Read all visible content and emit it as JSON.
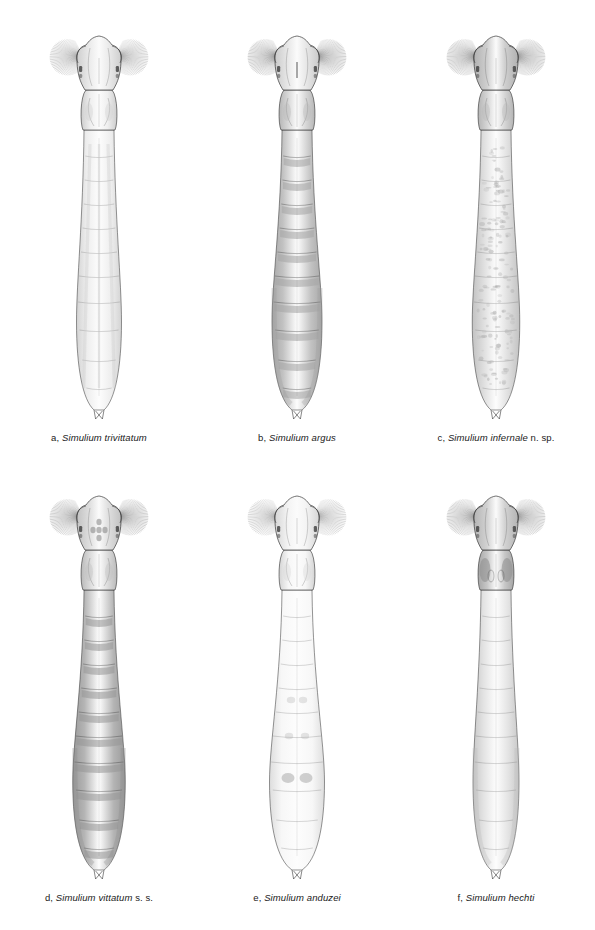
{
  "plate": {
    "type": "taxonomic-figure-plate",
    "background_color": "#ffffff",
    "ink_color": "#2b2b2b",
    "columns": 3,
    "rows": 2,
    "subject": "Simuliidae larvae, dorsal view",
    "panels": [
      {
        "letter": "a,",
        "genus": "Simulium",
        "species": "trivittatum",
        "qualifier": "",
        "caption_full": "a, Simulium trivittatum",
        "col": 0,
        "row": 0,
        "body_tone": "#f2f2f2",
        "abdomen_tone": "#ededed",
        "head_tone": "#ececec",
        "thorax_tone": "#efefef",
        "pattern": "faint-longitudinal-stripes",
        "abdomen_swell": 0.9,
        "fan_density": 46,
        "fan_tone": "#7d7d7d"
      },
      {
        "letter": "b,",
        "genus": "Simulium",
        "species": "argus",
        "qualifier": "",
        "caption_full": "b, Simulium argus",
        "col": 1,
        "row": 0,
        "body_tone": "#e6e6e6",
        "abdomen_tone": "#c2c2c2",
        "head_tone": "#e8e8e8",
        "thorax_tone": "#d8d8d8",
        "pattern": "banded-grey-abdomen",
        "abdomen_swell": 1.0,
        "fan_density": 50,
        "fan_tone": "#6e6e6e"
      },
      {
        "letter": "c,",
        "genus": "Simulium",
        "species": "infernale",
        "qualifier": "n. sp.",
        "caption_full": "c, Simulium infernale n. sp.",
        "col": 2,
        "row": 0,
        "body_tone": "#eaeaea",
        "abdomen_tone": "#dcdcdc",
        "head_tone": "#cfcfcf",
        "thorax_tone": "#d6d6d6",
        "pattern": "mottled-reticulate",
        "abdomen_swell": 0.95,
        "fan_density": 52,
        "fan_tone": "#707070"
      },
      {
        "letter": "d,",
        "genus": "Simulium",
        "species": "vittatum",
        "qualifier": "s. s.",
        "caption_full": "d, Simulium vittatum s. s.",
        "col": 0,
        "row": 1,
        "body_tone": "#e4e4e4",
        "abdomen_tone": "#b4b4b4",
        "head_tone": "#e0e0e0",
        "thorax_tone": "#dcdcdc",
        "pattern": "dark-banded-abdomen",
        "abdomen_swell": 1.05,
        "fan_density": 48,
        "fan_tone": "#6a6a6a"
      },
      {
        "letter": "e,",
        "genus": "Simulium",
        "species": "anduzei",
        "qualifier": "",
        "caption_full": "e, Simulium anduzei",
        "col": 1,
        "row": 1,
        "body_tone": "#fafafa",
        "abdomen_tone": "#f7f7f7",
        "head_tone": "#f4f4f4",
        "thorax_tone": "#f6f6f6",
        "pattern": "pale-with-paired-spots",
        "abdomen_swell": 1.1,
        "fan_density": 44,
        "fan_tone": "#828282"
      },
      {
        "letter": "f,",
        "genus": "Simulium",
        "species": "hechti",
        "qualifier": "",
        "caption_full": "f, Simulium hechti",
        "col": 2,
        "row": 1,
        "body_tone": "#ececec",
        "abdomen_tone": "#e2e2e2",
        "head_tone": "#d2d2d2",
        "thorax_tone": "#c8c8c8",
        "pattern": "dark-thorax-markings",
        "abdomen_swell": 0.92,
        "fan_density": 50,
        "fan_tone": "#6f6f6f"
      }
    ],
    "anatomy_labels": [
      "labral-fan",
      "head-capsule",
      "eye-spot",
      "antenna",
      "thorax",
      "abdomen",
      "abdominal-segment",
      "posterior-attachment-organ"
    ]
  }
}
